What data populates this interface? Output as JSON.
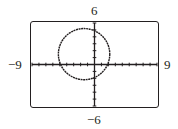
{
  "chart_data": {
    "type": "line",
    "title": "",
    "xlabel": "",
    "ylabel": "",
    "xlim": [
      -9,
      9
    ],
    "ylim": [
      -6,
      6
    ],
    "xscale": 1,
    "yscale": 1,
    "grid": false,
    "tick_labels": {
      "xmin": "−9",
      "xmax": "9",
      "ymin": "−6",
      "ymax": "6"
    },
    "series": [
      {
        "name": "circle",
        "shape": "circle",
        "center": [
          -1.5,
          1.5
        ],
        "radius": 3.7
      }
    ]
  },
  "labels": {
    "xmin": "−9",
    "xmax": "9",
    "ymin": "−6",
    "ymax": "6"
  }
}
